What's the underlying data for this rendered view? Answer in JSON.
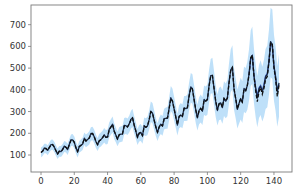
{
  "chart_data": {
    "type": "line",
    "title": "",
    "xlabel": "",
    "ylabel": "",
    "xlim": [
      -6,
      151
    ],
    "ylim": [
      9,
      792
    ],
    "grid": false,
    "legend": null,
    "x_ticks": [
      0,
      20,
      40,
      60,
      80,
      100,
      120,
      140
    ],
    "y_ticks": [
      100,
      200,
      300,
      400,
      500,
      600,
      700
    ],
    "series": [
      {
        "name": "actual",
        "style": "solid",
        "color": "#1a2a4a",
        "x_start": 0,
        "values": [
          112,
          118,
          132,
          129,
          121,
          135,
          148,
          148,
          136,
          119,
          104,
          118,
          115,
          126,
          141,
          135,
          125,
          149,
          170,
          170,
          158,
          133,
          114,
          140,
          145,
          150,
          178,
          163,
          172,
          178,
          199,
          199,
          184,
          162,
          146,
          166,
          171,
          180,
          193,
          181,
          183,
          218,
          230,
          242,
          209,
          191,
          172,
          194,
          196,
          196,
          236,
          235,
          229,
          243,
          264,
          272,
          237,
          211,
          180,
          201,
          204,
          188,
          235,
          227,
          234,
          264,
          302,
          293,
          259,
          229,
          203,
          229,
          242,
          233,
          267,
          269,
          270,
          315,
          364,
          347,
          312,
          274,
          237,
          278,
          284,
          277,
          317,
          313,
          318,
          374,
          413,
          405,
          355,
          306,
          271,
          306,
          315,
          301,
          356,
          348,
          355,
          422,
          465,
          467,
          404,
          347,
          305,
          336,
          340,
          318,
          362,
          348,
          363,
          435,
          491,
          505,
          404,
          359,
          310,
          337,
          360,
          342,
          406,
          396,
          420,
          472,
          548,
          559,
          463,
          407,
          362,
          405,
          417,
          391,
          419,
          461,
          472,
          535,
          622,
          606,
          508,
          461,
          390,
          432
        ]
      },
      {
        "name": "prediction",
        "style": "dashed",
        "color": "#111111",
        "x_start": 0,
        "values": [
          112,
          118,
          130,
          130,
          122,
          134,
          146,
          148,
          137,
          120,
          106,
          117,
          116,
          125,
          139,
          136,
          126,
          147,
          168,
          170,
          158,
          134,
          116,
          138,
          144,
          151,
          175,
          165,
          171,
          179,
          197,
          199,
          185,
          163,
          148,
          165,
          171,
          180,
          191,
          182,
          184,
          215,
          229,
          240,
          210,
          192,
          174,
          193,
          196,
          198,
          233,
          234,
          230,
          242,
          262,
          271,
          238,
          212,
          183,
          200,
          204,
          190,
          232,
          228,
          234,
          262,
          299,
          293,
          260,
          230,
          205,
          228,
          241,
          234,
          265,
          270,
          271,
          312,
          360,
          348,
          313,
          276,
          240,
          276,
          284,
          278,
          314,
          314,
          318,
          370,
          410,
          404,
          356,
          308,
          273,
          304,
          314,
          302,
          352,
          348,
          355,
          418,
          462,
          466,
          406,
          349,
          308,
          334,
          340,
          320,
          360,
          349,
          362,
          430,
          488,
          503,
          406,
          360,
          312,
          336,
          360,
          344,
          402,
          396,
          418,
          468,
          545,
          560,
          462,
          394,
          346,
          392,
          410,
          380,
          408,
          450,
          462,
          528,
          618,
          610,
          500,
          450,
          370,
          420
        ]
      },
      {
        "name": "forecast-mean",
        "style": "solid",
        "color": "#4a6fd0",
        "x_start": 125,
        "values": [
          468,
          540,
          555,
          465,
          410,
          372,
          410,
          420,
          395,
          425,
          465,
          475,
          530,
          615,
          600,
          505,
          455,
          395,
          425
        ]
      },
      {
        "name": "confidence-band",
        "style": "fill",
        "color": "#9fd0f5",
        "x_start": 0,
        "band_halfwidth": [
          22,
          22,
          22,
          22,
          23,
          23,
          24,
          24,
          24,
          24,
          24,
          24,
          25,
          25,
          25,
          25,
          26,
          26,
          27,
          27,
          27,
          27,
          27,
          27,
          28,
          28,
          29,
          29,
          29,
          30,
          31,
          31,
          31,
          31,
          30,
          31,
          32,
          32,
          33,
          33,
          33,
          35,
          36,
          37,
          36,
          35,
          34,
          35,
          36,
          36,
          38,
          38,
          38,
          39,
          41,
          42,
          40,
          39,
          37,
          38,
          39,
          38,
          41,
          41,
          42,
          44,
          47,
          47,
          45,
          43,
          41,
          43,
          45,
          45,
          48,
          49,
          50,
          53,
          57,
          57,
          55,
          52,
          50,
          53,
          55,
          55,
          58,
          58,
          60,
          64,
          68,
          68,
          65,
          62,
          60,
          62,
          64,
          64,
          68,
          68,
          70,
          76,
          80,
          82,
          78,
          74,
          72,
          74,
          76,
          76,
          80,
          80,
          84,
          92,
          98,
          102,
          96,
          92,
          90,
          92,
          96,
          96,
          104,
          104,
          110,
          118,
          128,
          132,
          126,
          122,
          118,
          122,
          126,
          126,
          132,
          138,
          142,
          150,
          160,
          160,
          152,
          148,
          140,
          144
        ]
      }
    ]
  }
}
